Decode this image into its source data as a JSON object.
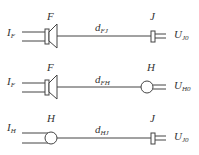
{
  "diagram": {
    "rows": [
      {
        "input": {
          "main": "I",
          "sub": "F"
        },
        "left_label": "F",
        "left_element": "speaker",
        "distance": {
          "main": "d",
          "sub": "FJ"
        },
        "right_label": "J",
        "right_element": "jack",
        "output": {
          "main": "U",
          "sub": "J0"
        }
      },
      {
        "input": {
          "main": "I",
          "sub": "F"
        },
        "left_label": "F",
        "left_element": "speaker",
        "distance": {
          "main": "d",
          "sub": "FH"
        },
        "right_label": "H",
        "right_element": "sphere",
        "output": {
          "main": "U",
          "sub": "H0"
        }
      },
      {
        "input": {
          "main": "I",
          "sub": "H"
        },
        "left_label": "H",
        "left_element": "sphere",
        "distance": {
          "main": "d",
          "sub": "HJ"
        },
        "right_label": "J",
        "right_element": "jack",
        "output": {
          "main": "U",
          "sub": "J0"
        }
      }
    ],
    "stroke_color": "#444444"
  }
}
